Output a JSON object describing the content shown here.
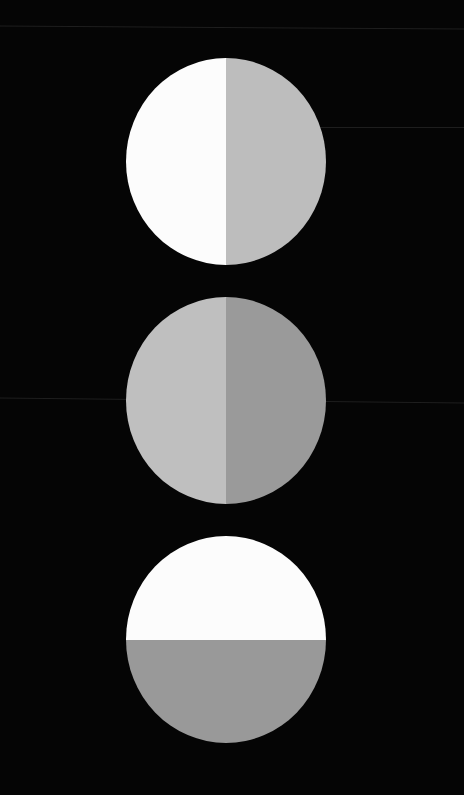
{
  "background": "#050505",
  "discs": [
    {
      "name": "disc-1",
      "split": "vertical",
      "center": [
        225,
        161
      ],
      "colors": {
        "first": "#fcfcfc",
        "second": "#bdbdbd"
      }
    },
    {
      "name": "disc-2",
      "split": "vertical",
      "center": [
        225,
        401
      ],
      "colors": {
        "first": "#bfbfbf",
        "second": "#9a9a9a"
      }
    },
    {
      "name": "disc-3",
      "split": "horizontal",
      "center": [
        225,
        639
      ],
      "colors": {
        "first": "#fcfcfc",
        "second": "#999999"
      }
    }
  ]
}
